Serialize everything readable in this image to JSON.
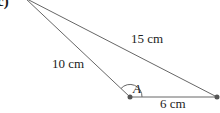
{
  "part_label": "c)",
  "triangle": {
    "sides": {
      "left": "10 cm",
      "top": "15 cm",
      "bottom": "6 cm"
    },
    "angle_label": "A",
    "colors": {
      "line": "#666666",
      "vertex": "#555555"
    }
  }
}
